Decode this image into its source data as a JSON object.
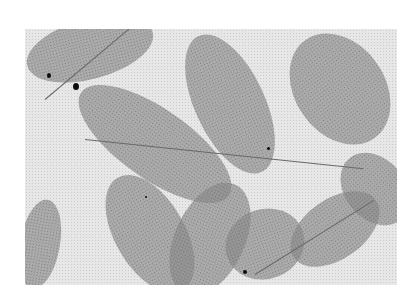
{
  "image": {
    "description": "Grayscale micrograph of feather-like dendritic (frond) structures on a light background",
    "colors": {
      "background": "#e2e2e2",
      "structure": "#6e6e6e",
      "spots": "#111111"
    },
    "fronds": [
      {
        "x": 0,
        "y": 0,
        "w": 130,
        "h": 60,
        "rot": -15
      },
      {
        "x": 40,
        "y": 80,
        "w": 180,
        "h": 70,
        "rot": 35
      },
      {
        "x": 170,
        "y": 0,
        "w": 70,
        "h": 150,
        "rot": -25
      },
      {
        "x": 270,
        "y": 0,
        "w": 90,
        "h": 120,
        "rot": -35
      },
      {
        "x": 0,
        "y": 170,
        "w": 40,
        "h": 90,
        "rot": 10
      },
      {
        "x": 90,
        "y": 140,
        "w": 70,
        "h": 130,
        "rot": -30
      },
      {
        "x": 150,
        "y": 150,
        "w": 70,
        "h": 120,
        "rot": 25
      },
      {
        "x": 200,
        "y": 180,
        "w": 80,
        "h": 70,
        "rot": -20
      },
      {
        "x": 260,
        "y": 170,
        "w": 100,
        "h": 60,
        "rot": -35
      },
      {
        "x": 320,
        "y": 120,
        "w": 60,
        "h": 80,
        "rot": -40
      }
    ]
  }
}
